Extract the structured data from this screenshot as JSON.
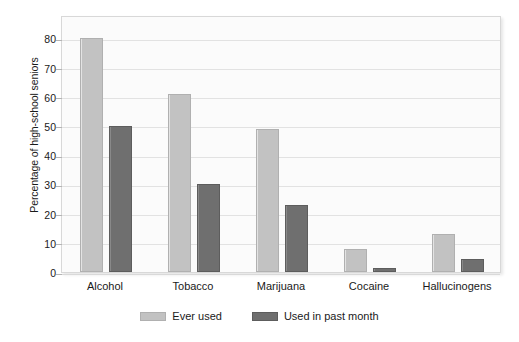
{
  "chart_data": {
    "type": "bar",
    "title": "",
    "xlabel": "",
    "ylabel": "Percentage of high-school seniors",
    "categories": [
      "Alcohol",
      "Tobacco",
      "Marijuana",
      "Cocaine",
      "Hallucinogens"
    ],
    "series": [
      {
        "name": "Ever used",
        "color": "#c2c2c2",
        "values": [
          80,
          61,
          49,
          8,
          13
        ]
      },
      {
        "name": "Used in past month",
        "color": "#6f6f6f",
        "values": [
          50,
          30,
          23,
          1.5,
          4.5
        ]
      }
    ],
    "ylim": [
      0,
      88
    ],
    "yticks": [
      0,
      10,
      20,
      30,
      40,
      50,
      60,
      70,
      80
    ],
    "ytick_labels": [
      "0",
      "10",
      "20",
      "30",
      "40",
      "50",
      "60",
      "70",
      "80"
    ],
    "grid": true,
    "legend_position": "bottom"
  }
}
